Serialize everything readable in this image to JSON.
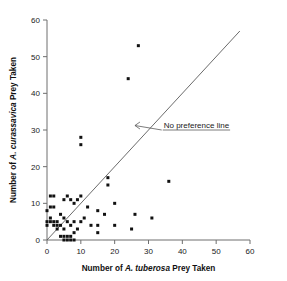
{
  "chart_data": {
    "type": "scatter",
    "title": "",
    "xlabel_prefix": "Number of ",
    "xlabel_species": "A. tuberosa",
    "xlabel_suffix": " Prey Taken",
    "ylabel_prefix": "Number of ",
    "ylabel_species": "A. curassavica",
    "ylabel_suffix": " Prey Taken",
    "xlim": [
      0,
      60
    ],
    "ylim": [
      0,
      60
    ],
    "xticks": [
      0,
      10,
      20,
      30,
      40,
      50,
      60
    ],
    "yticks": [
      0,
      10,
      20,
      30,
      40,
      50,
      60
    ],
    "xticklabels": [
      "0",
      "10",
      "20",
      "30",
      "40",
      "50",
      "60"
    ],
    "yticklabels": [
      "0",
      "10",
      "20",
      "30",
      "40",
      "50",
      "60"
    ],
    "grid": false,
    "legend": "none",
    "marker": "filled-square",
    "marker_color": "#111111",
    "annotations": [
      {
        "text": "No preference line",
        "x": 34.5,
        "y": 31.5,
        "arrow_to_x": 26.0,
        "arrow_to_y": 31.5
      }
    ],
    "reference_line": {
      "name": "no-preference-line",
      "kind": "identity",
      "from": [
        0,
        0
      ],
      "to": [
        57,
        57
      ],
      "color": "#5a5a5a"
    },
    "points": [
      [
        0,
        8
      ],
      [
        0,
        5
      ],
      [
        0,
        4
      ],
      [
        1,
        12
      ],
      [
        1,
        9
      ],
      [
        1,
        6
      ],
      [
        1,
        5
      ],
      [
        2,
        12
      ],
      [
        2,
        9
      ],
      [
        2,
        5
      ],
      [
        2,
        4
      ],
      [
        3,
        5
      ],
      [
        3,
        4
      ],
      [
        3,
        3
      ],
      [
        4,
        7
      ],
      [
        4,
        4
      ],
      [
        4,
        1
      ],
      [
        5,
        11
      ],
      [
        5,
        6
      ],
      [
        5,
        3
      ],
      [
        5,
        1
      ],
      [
        5,
        0
      ],
      [
        6,
        12
      ],
      [
        6,
        1
      ],
      [
        6,
        0
      ],
      [
        6,
        5
      ],
      [
        7,
        11
      ],
      [
        7,
        4
      ],
      [
        7,
        1
      ],
      [
        7,
        0
      ],
      [
        8,
        10
      ],
      [
        8,
        5
      ],
      [
        8,
        2
      ],
      [
        8,
        0
      ],
      [
        9,
        11
      ],
      [
        9,
        3
      ],
      [
        10,
        28
      ],
      [
        10,
        26
      ],
      [
        10,
        12
      ],
      [
        10,
        5
      ],
      [
        11,
        6
      ],
      [
        12,
        9
      ],
      [
        13,
        4
      ],
      [
        15,
        8
      ],
      [
        15,
        4
      ],
      [
        15,
        2
      ],
      [
        17,
        7
      ],
      [
        18,
        17
      ],
      [
        18,
        15
      ],
      [
        20,
        10
      ],
      [
        20,
        4
      ],
      [
        24,
        44
      ],
      [
        25,
        3
      ],
      [
        26,
        7
      ],
      [
        27,
        53
      ],
      [
        31,
        6
      ],
      [
        36,
        16
      ]
    ]
  }
}
